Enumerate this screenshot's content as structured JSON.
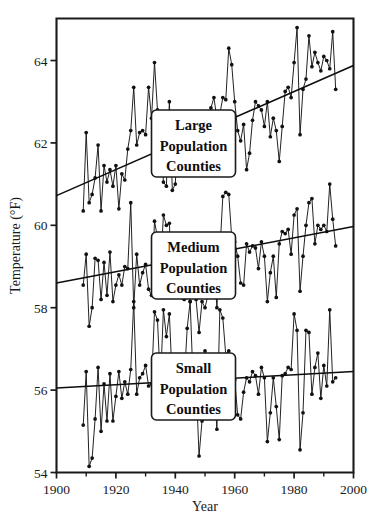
{
  "chart_data": {
    "type": "line",
    "title": "",
    "xlabel": "Year",
    "ylabel": "Temperature (°F)",
    "xlim": [
      1900,
      2000
    ],
    "ylim": [
      54,
      65.02
    ],
    "xticks": [
      1900,
      1920,
      1940,
      1960,
      1980,
      2000
    ],
    "xticklabels": [
      "1900",
      "1920",
      "1940",
      "1960",
      "1980",
      "2000"
    ],
    "xminorticks": [
      1910,
      1930,
      1950,
      1970,
      1990
    ],
    "yticks": [
      54,
      56,
      58,
      60,
      62,
      64
    ],
    "yticklabels": [
      "54",
      "56",
      "58",
      "60",
      "62",
      "64"
    ],
    "grid": false,
    "legend_position": "inside-center",
    "marker": "filled-circle",
    "series": [
      {
        "name": "Large Population Counties",
        "label_lines": [
          "Large",
          "Population",
          "Counties"
        ],
        "trend": {
          "x": [
            1900,
            2000
          ],
          "y": [
            60.72,
            63.88
          ]
        },
        "x": [
          1909,
          1910,
          1911,
          1912,
          1913,
          1914,
          1915,
          1916,
          1917,
          1918,
          1919,
          1920,
          1921,
          1922,
          1923,
          1924,
          1925,
          1926,
          1927,
          1928,
          1929,
          1930,
          1931,
          1932,
          1933,
          1934,
          1935,
          1936,
          1937,
          1938,
          1939,
          1940,
          1941,
          1942,
          1943,
          1944,
          1945,
          1946,
          1947,
          1948,
          1949,
          1950,
          1951,
          1952,
          1953,
          1954,
          1955,
          1956,
          1957,
          1958,
          1959,
          1960,
          1961,
          1962,
          1963,
          1964,
          1965,
          1966,
          1967,
          1968,
          1969,
          1970,
          1971,
          1972,
          1973,
          1974,
          1975,
          1976,
          1977,
          1978,
          1979,
          1980,
          1981,
          1982,
          1983,
          1984,
          1985,
          1986,
          1987,
          1988,
          1989,
          1990,
          1991,
          1992,
          1993,
          1994
        ],
        "y": [
          60.35,
          62.25,
          60.55,
          60.75,
          61.15,
          61.95,
          60.35,
          61.45,
          61.05,
          61.35,
          60.95,
          61.45,
          60.4,
          61.25,
          61.1,
          61.85,
          62.3,
          63.35,
          61.95,
          62.25,
          62.3,
          62.2,
          63.35,
          62.6,
          63.95,
          62.8,
          62.55,
          61.05,
          60.95,
          63.0,
          60.85,
          61.0,
          62.6,
          62.4,
          62.25,
          62.35,
          62.45,
          62.7,
          62.4,
          62.15,
          62.55,
          62.3,
          62.6,
          62.85,
          63.1,
          62.6,
          62.7,
          63.1,
          63.05,
          64.3,
          63.9,
          63.0,
          62.3,
          62.05,
          62.45,
          61.35,
          61.75,
          62.55,
          63.0,
          62.9,
          62.8,
          62.4,
          63.0,
          62.15,
          62.6,
          62.3,
          61.55,
          62.4,
          63.25,
          63.35,
          63.1,
          63.95,
          64.8,
          62.2,
          63.3,
          63.55,
          64.6,
          63.85,
          64.2,
          63.95,
          63.75,
          64.1,
          64.0,
          63.8,
          64.7,
          63.3
        ]
      },
      {
        "name": "Medium Population Counties",
        "label_lines": [
          "Medium",
          "Population",
          "Counties"
        ],
        "trend": {
          "x": [
            1900,
            2000
          ],
          "y": [
            58.6,
            59.97
          ]
        },
        "x": [
          1909,
          1910,
          1911,
          1912,
          1913,
          1914,
          1915,
          1916,
          1917,
          1918,
          1919,
          1920,
          1921,
          1922,
          1923,
          1924,
          1925,
          1926,
          1927,
          1928,
          1929,
          1930,
          1931,
          1932,
          1933,
          1934,
          1935,
          1936,
          1937,
          1938,
          1939,
          1940,
          1941,
          1942,
          1943,
          1944,
          1945,
          1946,
          1947,
          1948,
          1949,
          1950,
          1951,
          1952,
          1953,
          1954,
          1955,
          1956,
          1957,
          1958,
          1959,
          1960,
          1961,
          1962,
          1963,
          1964,
          1965,
          1966,
          1967,
          1968,
          1969,
          1970,
          1971,
          1972,
          1973,
          1974,
          1975,
          1976,
          1977,
          1978,
          1979,
          1980,
          1981,
          1982,
          1983,
          1984,
          1985,
          1986,
          1987,
          1988,
          1989,
          1990,
          1991,
          1992,
          1993,
          1994
        ],
        "y": [
          58.55,
          59.3,
          57.55,
          58.0,
          59.2,
          59.15,
          58.2,
          59.1,
          58.3,
          59.35,
          58.15,
          58.55,
          58.8,
          58.55,
          59.0,
          58.95,
          60.55,
          58.0,
          59.3,
          58.55,
          58.85,
          59.05,
          58.45,
          58.3,
          60.1,
          59.7,
          58.9,
          60.25,
          60.0,
          60.05,
          58.3,
          59.0,
          58.95,
          58.25,
          58.2,
          59.3,
          58.15,
          59.25,
          58.2,
          57.4,
          58.15,
          58.0,
          58.3,
          59.1,
          59.15,
          58.0,
          59.35,
          60.7,
          60.8,
          60.75,
          59.7,
          59.6,
          59.25,
          58.6,
          58.55,
          59.55,
          59.35,
          59.5,
          59.45,
          58.95,
          59.6,
          59.25,
          58.15,
          58.85,
          59.25,
          58.25,
          59.55,
          59.85,
          59.8,
          59.9,
          59.3,
          60.25,
          60.4,
          58.4,
          59.25,
          60.0,
          60.55,
          60.65,
          59.55,
          60.0,
          59.9,
          60.0,
          59.85,
          61.0,
          60.15,
          59.5
        ]
      },
      {
        "name": "Small Population Counties",
        "label_lines": [
          "Small",
          "Population",
          "Counties"
        ],
        "trend": {
          "x": [
            1900,
            2000
          ],
          "y": [
            56.05,
            56.45
          ]
        },
        "x": [
          1909,
          1910,
          1911,
          1912,
          1913,
          1914,
          1915,
          1916,
          1917,
          1918,
          1919,
          1920,
          1921,
          1922,
          1923,
          1924,
          1925,
          1926,
          1927,
          1928,
          1929,
          1930,
          1931,
          1932,
          1933,
          1934,
          1935,
          1936,
          1937,
          1938,
          1939,
          1940,
          1941,
          1942,
          1943,
          1944,
          1945,
          1946,
          1947,
          1948,
          1949,
          1950,
          1951,
          1952,
          1953,
          1954,
          1955,
          1956,
          1957,
          1958,
          1959,
          1960,
          1961,
          1962,
          1963,
          1964,
          1965,
          1966,
          1967,
          1968,
          1969,
          1970,
          1971,
          1972,
          1973,
          1974,
          1975,
          1976,
          1977,
          1978,
          1979,
          1980,
          1981,
          1982,
          1983,
          1984,
          1985,
          1986,
          1987,
          1988,
          1989,
          1990,
          1991,
          1992,
          1993,
          1994
        ],
        "y": [
          55.15,
          56.45,
          54.15,
          54.35,
          55.3,
          56.55,
          55.0,
          56.15,
          55.25,
          56.4,
          55.25,
          55.85,
          56.45,
          55.8,
          56.2,
          55.9,
          56.5,
          58.15,
          55.9,
          56.3,
          56.4,
          56.6,
          56.1,
          56.15,
          57.9,
          57.7,
          56.15,
          57.95,
          57.3,
          57.85,
          56.2,
          56.15,
          56.15,
          56.3,
          56.2,
          57.5,
          58.15,
          56.2,
          56.2,
          54.4,
          55.25,
          56.95,
          56.2,
          56.2,
          56.3,
          55.05,
          57.95,
          57.75,
          56.85,
          56.95,
          56.3,
          56.25,
          55.4,
          55.3,
          55.95,
          56.3,
          56.2,
          56.45,
          56.35,
          55.9,
          56.55,
          56.3,
          54.75,
          55.45,
          56.3,
          55.6,
          54.8,
          56.35,
          56.4,
          56.55,
          56.5,
          57.85,
          57.45,
          54.55,
          55.45,
          57.45,
          57.4,
          55.9,
          56.55,
          56.9,
          55.8,
          56.6,
          56.1,
          57.95,
          56.2,
          56.3
        ]
      }
    ]
  },
  "legend_boxes": [
    {
      "series": "Large Population Counties",
      "lines": [
        "Large",
        "Population",
        "Counties"
      ]
    },
    {
      "series": "Medium Population Counties",
      "lines": [
        "Medium",
        "Population",
        "Counties"
      ]
    },
    {
      "series": "Small Population Counties",
      "lines": [
        "Small",
        "Population",
        "Counties"
      ]
    }
  ]
}
